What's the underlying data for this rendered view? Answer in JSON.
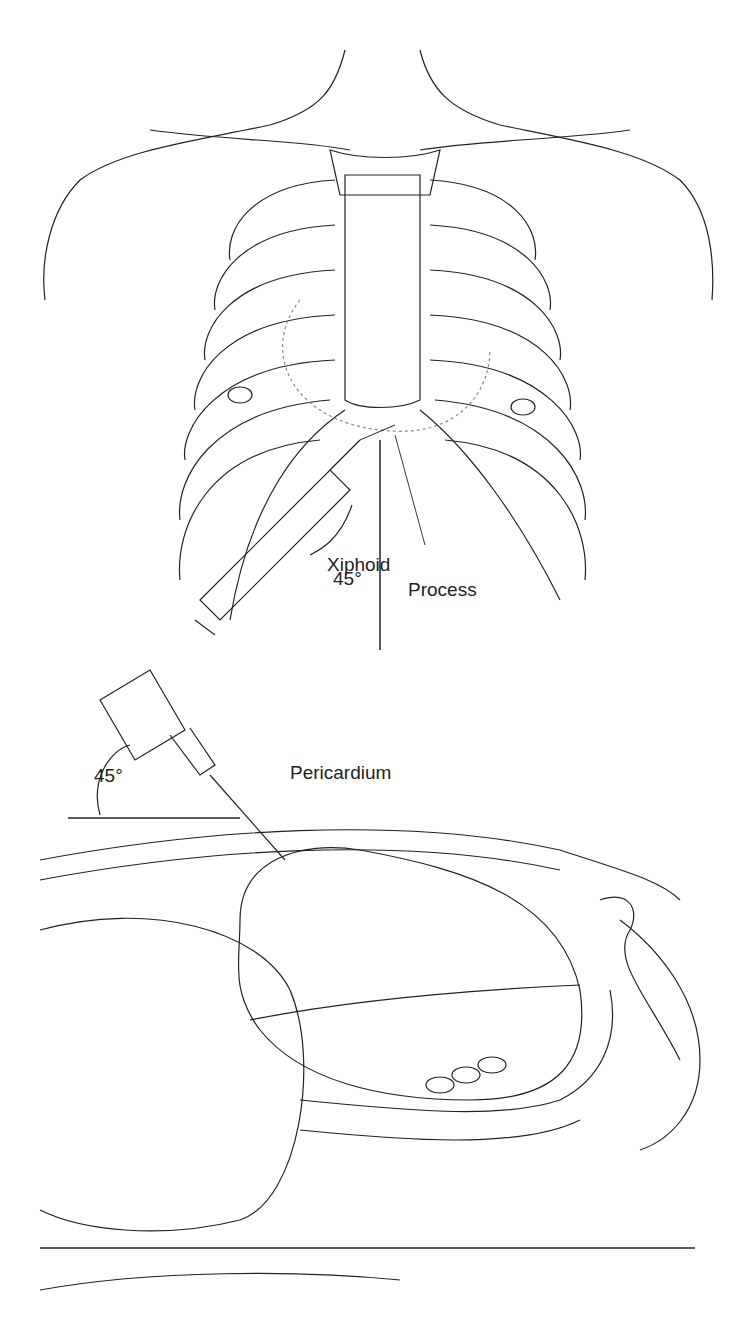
{
  "figure": {
    "top_panel": {
      "angle_label": "45°",
      "xiphoid_label_line1": "Xiphoid",
      "xiphoid_label_line2": "Process"
    },
    "bottom_panel": {
      "angle_label": "45°",
      "pericardium_label": "Pericardium"
    },
    "colors": {
      "ink": "#222222",
      "background": "#ffffff"
    }
  }
}
